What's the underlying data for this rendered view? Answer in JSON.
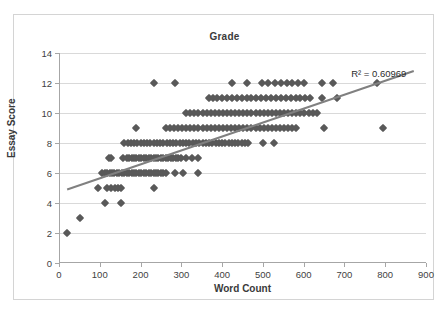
{
  "chart_data": {
    "type": "scatter",
    "title": "Grade",
    "xlabel": "Word Count",
    "ylabel": "Essay Score",
    "xlim": [
      0,
      900
    ],
    "ylim": [
      0,
      14
    ],
    "xticks": [
      0,
      100,
      200,
      300,
      400,
      500,
      600,
      700,
      800,
      900
    ],
    "yticks": [
      0,
      2,
      4,
      6,
      8,
      10,
      12,
      14
    ],
    "grid": "horizontal",
    "legend": "none",
    "marker_color": "#595959",
    "trendline_color": "#808080",
    "gridline_color": "#d9d9d9",
    "annotations": [
      {
        "text": "R² = 0.60969",
        "x": 790,
        "y": 12.6
      }
    ],
    "trendline": {
      "type": "linear",
      "x0": 20,
      "y0": 4.9,
      "x1": 870,
      "y1": 12.8,
      "r_squared": 0.60969
    },
    "points": [
      [
        20,
        2
      ],
      [
        52,
        3
      ],
      [
        112,
        4
      ],
      [
        152,
        4
      ],
      [
        95,
        5
      ],
      [
        118,
        5
      ],
      [
        128,
        5
      ],
      [
        137,
        5
      ],
      [
        145,
        5
      ],
      [
        152,
        5
      ],
      [
        232,
        5
      ],
      [
        122,
        7
      ],
      [
        128,
        7
      ],
      [
        188,
        9
      ],
      [
        232,
        12
      ],
      [
        285,
        12
      ],
      [
        105,
        6
      ],
      [
        112,
        6
      ],
      [
        118,
        6
      ],
      [
        124,
        6
      ],
      [
        130,
        6
      ],
      [
        136,
        6
      ],
      [
        142,
        6
      ],
      [
        148,
        6
      ],
      [
        154,
        6
      ],
      [
        160,
        6
      ],
      [
        166,
        6
      ],
      [
        172,
        6
      ],
      [
        178,
        6
      ],
      [
        184,
        6
      ],
      [
        190,
        6
      ],
      [
        196,
        6
      ],
      [
        202,
        6
      ],
      [
        208,
        6
      ],
      [
        214,
        6
      ],
      [
        220,
        6
      ],
      [
        226,
        6
      ],
      [
        232,
        6
      ],
      [
        238,
        6
      ],
      [
        244,
        6
      ],
      [
        250,
        6
      ],
      [
        256,
        6
      ],
      [
        262,
        6
      ],
      [
        285,
        6
      ],
      [
        305,
        6
      ],
      [
        342,
        6
      ],
      [
        158,
        7
      ],
      [
        166,
        7
      ],
      [
        172,
        7
      ],
      [
        178,
        7
      ],
      [
        184,
        7
      ],
      [
        190,
        7
      ],
      [
        196,
        7
      ],
      [
        202,
        7
      ],
      [
        208,
        7
      ],
      [
        214,
        7
      ],
      [
        220,
        7
      ],
      [
        226,
        7
      ],
      [
        232,
        7
      ],
      [
        238,
        7
      ],
      [
        244,
        7
      ],
      [
        250,
        7
      ],
      [
        256,
        7
      ],
      [
        262,
        7
      ],
      [
        268,
        7
      ],
      [
        274,
        7
      ],
      [
        280,
        7
      ],
      [
        286,
        7
      ],
      [
        292,
        7
      ],
      [
        300,
        7
      ],
      [
        312,
        7
      ],
      [
        325,
        7
      ],
      [
        340,
        7
      ],
      [
        160,
        8
      ],
      [
        168,
        8
      ],
      [
        176,
        8
      ],
      [
        184,
        8
      ],
      [
        192,
        8
      ],
      [
        200,
        8
      ],
      [
        208,
        8
      ],
      [
        216,
        8
      ],
      [
        224,
        8
      ],
      [
        232,
        8
      ],
      [
        240,
        8
      ],
      [
        248,
        8
      ],
      [
        256,
        8
      ],
      [
        264,
        8
      ],
      [
        272,
        8
      ],
      [
        280,
        8
      ],
      [
        288,
        8
      ],
      [
        296,
        8
      ],
      [
        304,
        8
      ],
      [
        312,
        8
      ],
      [
        320,
        8
      ],
      [
        328,
        8
      ],
      [
        336,
        8
      ],
      [
        344,
        8
      ],
      [
        352,
        8
      ],
      [
        360,
        8
      ],
      [
        368,
        8
      ],
      [
        376,
        8
      ],
      [
        384,
        8
      ],
      [
        392,
        8
      ],
      [
        400,
        8
      ],
      [
        408,
        8
      ],
      [
        416,
        8
      ],
      [
        424,
        8
      ],
      [
        432,
        8
      ],
      [
        440,
        8
      ],
      [
        448,
        8
      ],
      [
        456,
        8
      ],
      [
        464,
        8
      ],
      [
        500,
        8
      ],
      [
        528,
        8
      ],
      [
        262,
        9
      ],
      [
        272,
        9
      ],
      [
        282,
        9
      ],
      [
        292,
        9
      ],
      [
        302,
        9
      ],
      [
        312,
        9
      ],
      [
        322,
        9
      ],
      [
        332,
        9
      ],
      [
        342,
        9
      ],
      [
        352,
        9
      ],
      [
        362,
        9
      ],
      [
        372,
        9
      ],
      [
        382,
        9
      ],
      [
        392,
        9
      ],
      [
        402,
        9
      ],
      [
        412,
        9
      ],
      [
        422,
        9
      ],
      [
        432,
        9
      ],
      [
        442,
        9
      ],
      [
        452,
        9
      ],
      [
        462,
        9
      ],
      [
        472,
        9
      ],
      [
        482,
        9
      ],
      [
        492,
        9
      ],
      [
        502,
        9
      ],
      [
        512,
        9
      ],
      [
        522,
        9
      ],
      [
        532,
        9
      ],
      [
        542,
        9
      ],
      [
        552,
        9
      ],
      [
        562,
        9
      ],
      [
        572,
        9
      ],
      [
        582,
        9
      ],
      [
        650,
        9
      ],
      [
        795,
        9
      ],
      [
        312,
        10
      ],
      [
        322,
        10
      ],
      [
        332,
        10
      ],
      [
        342,
        10
      ],
      [
        352,
        10
      ],
      [
        362,
        10
      ],
      [
        372,
        10
      ],
      [
        382,
        10
      ],
      [
        392,
        10
      ],
      [
        402,
        10
      ],
      [
        412,
        10
      ],
      [
        422,
        10
      ],
      [
        432,
        10
      ],
      [
        442,
        10
      ],
      [
        452,
        10
      ],
      [
        462,
        10
      ],
      [
        472,
        10
      ],
      [
        482,
        10
      ],
      [
        492,
        10
      ],
      [
        502,
        10
      ],
      [
        512,
        10
      ],
      [
        522,
        10
      ],
      [
        532,
        10
      ],
      [
        542,
        10
      ],
      [
        552,
        10
      ],
      [
        562,
        10
      ],
      [
        572,
        10
      ],
      [
        582,
        10
      ],
      [
        592,
        10
      ],
      [
        602,
        10
      ],
      [
        612,
        10
      ],
      [
        622,
        10
      ],
      [
        632,
        10
      ],
      [
        368,
        11
      ],
      [
        378,
        11
      ],
      [
        388,
        11
      ],
      [
        400,
        11
      ],
      [
        412,
        11
      ],
      [
        424,
        11
      ],
      [
        436,
        11
      ],
      [
        448,
        11
      ],
      [
        460,
        11
      ],
      [
        472,
        11
      ],
      [
        484,
        11
      ],
      [
        496,
        11
      ],
      [
        508,
        11
      ],
      [
        520,
        11
      ],
      [
        532,
        11
      ],
      [
        544,
        11
      ],
      [
        556,
        11
      ],
      [
        568,
        11
      ],
      [
        580,
        11
      ],
      [
        592,
        11
      ],
      [
        604,
        11
      ],
      [
        616,
        11
      ],
      [
        645,
        11
      ],
      [
        682,
        11
      ],
      [
        425,
        12
      ],
      [
        462,
        12
      ],
      [
        498,
        12
      ],
      [
        512,
        12
      ],
      [
        530,
        12
      ],
      [
        545,
        12
      ],
      [
        558,
        12
      ],
      [
        572,
        12
      ],
      [
        585,
        12
      ],
      [
        600,
        12
      ],
      [
        645,
        12
      ],
      [
        672,
        12
      ],
      [
        780,
        12
      ]
    ]
  }
}
